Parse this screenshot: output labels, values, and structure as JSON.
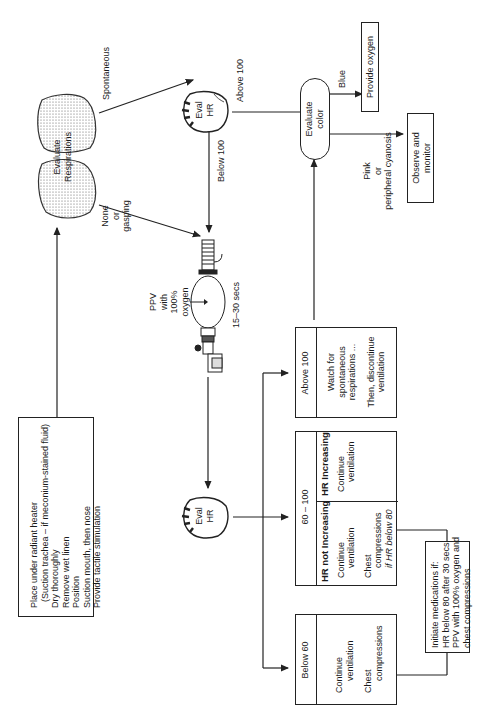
{
  "diagram": {
    "orientation": "rotated 90° counter-clockwise",
    "initial_steps": {
      "lines": [
        "Place under radiant heater",
        "(Suction trachea – if meconium-stained fluid)",
        "Dry thoroughly",
        "Remove wet linen",
        "Position",
        "Suction mouth, then nose",
        "Provide tactile stimulation"
      ]
    },
    "evaluate_respirations": {
      "label_line1": "Evaluate",
      "label_line2": "Respirations",
      "icon": "lungs-icon"
    },
    "respiration_branches": {
      "spontaneous": "Spontaneous",
      "none_line1": "None",
      "none_line2": "or",
      "none_line3": "gasping"
    },
    "eval_hr_top": {
      "line1": "Eval",
      "line2": "HR",
      "icon": "heart-icon"
    },
    "hr_top_branches": {
      "above": "Above 100",
      "below": "Below 100"
    },
    "evaluate_color": {
      "line1": "Evaluate",
      "line2": "color"
    },
    "color_branches": {
      "blue": "Blue",
      "pink_line1": "Pink",
      "pink_line2": "or",
      "pink_line3": "peripheral cyanosis"
    },
    "provide_oxygen": "Provide oxygen",
    "observe_monitor": {
      "line1": "Observe and",
      "line2": "monitor"
    },
    "ppv": {
      "line1": "PPV",
      "line2": "with",
      "line3": "100%",
      "line4": "oxygen",
      "duration": "15–30 secs",
      "icon": "bag-valve-mask-icon"
    },
    "eval_hr_bottom": {
      "line1": "Eval",
      "line2": "HR",
      "icon": "heart-icon"
    },
    "outcomes": {
      "above_100": {
        "header": "Above 100",
        "lines": [
          "Watch for",
          "spontaneous",
          "respirations ...",
          "",
          "Then, discontinue",
          "ventilation"
        ]
      },
      "range_60_100": {
        "header": "60 – 100",
        "not_increasing": {
          "title": "HR not Increasing",
          "lines": [
            "Continue",
            "ventilation",
            "",
            "Chest",
            "compressions",
            "if HR below 80"
          ]
        },
        "increasing": {
          "title": "HR Increasing",
          "lines": [
            "Continue",
            "ventilation"
          ]
        }
      },
      "below_60": {
        "header": "Below 60",
        "lines": [
          "Continue",
          "ventilation",
          "",
          "Chest",
          "compressions"
        ]
      }
    },
    "medications": {
      "lines": [
        "Initiate medications if:",
        "HR below 80 after 30 secs",
        "PPV with 100% oxygen and",
        "chest compressions"
      ]
    }
  }
}
